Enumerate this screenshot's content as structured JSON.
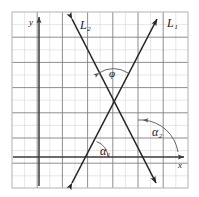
{
  "figure": {
    "background_color": "#ffffff",
    "frame": {
      "x": 12,
      "y": 12,
      "width": 176,
      "height": 176,
      "border_color": "#b9b9b9"
    },
    "grid": {
      "minor_spacing": 12.6,
      "minor_color": "#d9d9d9",
      "major_spacing": 25.2,
      "major_color": "#6e6e6e",
      "visible": true
    },
    "axes": {
      "color": "#3a3a3a",
      "x_axis": {
        "label": "x",
        "label_x": 180,
        "label_y": 166,
        "y_position": 157,
        "x_start": 13,
        "x_end": 186
      },
      "y_axis": {
        "label": "y",
        "label_x": 31,
        "label_y": 24,
        "x_position": 39,
        "y_start": 186,
        "y_end": 15
      }
    },
    "lines": [
      {
        "name": "L1",
        "label": "L₁",
        "label_x": 167,
        "label_y": 27,
        "color": "#262626",
        "from_x": 70,
        "from_y": 186,
        "to_x": 159,
        "to_y": 16,
        "arrows": "both"
      },
      {
        "name": "L2",
        "label": "L₂",
        "label_x": 80,
        "label_y": 29,
        "color": "#262626",
        "from_x": 70,
        "from_y": 16,
        "to_x": 158,
        "to_y": 186,
        "arrows": "both"
      }
    ],
    "intersection": {
      "x": 114,
      "y": 102
    },
    "angles": [
      {
        "name": "phi",
        "label": "φ",
        "label_x": 113,
        "label_y": 74,
        "description": "angle between L1 and L2 at their intersection, opening upward",
        "arc_color": "#555555"
      },
      {
        "name": "alpha1",
        "label": "α₁",
        "label_x": 105,
        "label_y": 152,
        "description": "inclination angle of L1 measured from the x-axis",
        "arc_color": "#555555"
      },
      {
        "name": "alpha2",
        "label": "α₂",
        "label_x": 158,
        "label_y": 133,
        "description": "inclination angle of L2 measured from the x-axis",
        "arc_color": "#555555"
      }
    ]
  }
}
